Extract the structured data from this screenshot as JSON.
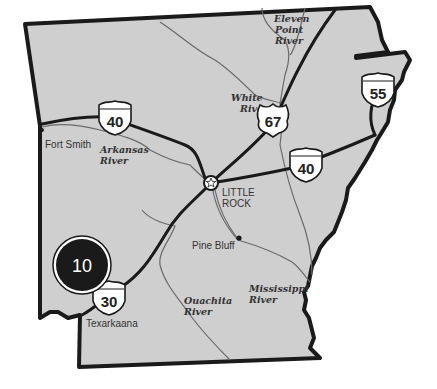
{
  "map": {
    "region": "Arkansas",
    "colors": {
      "land": "#cfcfcf",
      "border": "#1a1a1a",
      "highway": "#1a1a1a",
      "river": "#6a6a6a",
      "shield_fill": "#ffffff",
      "badge_fill": "#1a1a1a"
    },
    "badge": {
      "label": "10"
    },
    "cities": [
      {
        "id": "fort-smith",
        "name": "Fort Smith"
      },
      {
        "id": "little-rock-line1",
        "name": "LITTLE"
      },
      {
        "id": "little-rock-line2",
        "name": "ROCK"
      },
      {
        "id": "pine-bluff",
        "name": "Pine Bluff"
      },
      {
        "id": "texarkana",
        "name": "Texarkaana"
      }
    ],
    "rivers": [
      {
        "id": "arkansas",
        "line1": "Arkansas",
        "line2": "River"
      },
      {
        "id": "white",
        "line1": "White",
        "line2": "River"
      },
      {
        "id": "eleven-point",
        "line1": "Eleven",
        "line2": "Point",
        "line3": "River"
      },
      {
        "id": "ouachita",
        "line1": "Ouachita",
        "line2": "River"
      },
      {
        "id": "mississippi",
        "line1": "Mississippi",
        "line2": "River"
      }
    ],
    "highways": [
      {
        "id": "i40-west",
        "type": "interstate",
        "number": "40"
      },
      {
        "id": "us67",
        "type": "us-route",
        "number": "67"
      },
      {
        "id": "i55",
        "type": "interstate",
        "number": "55"
      },
      {
        "id": "i40-east",
        "type": "interstate",
        "number": "40"
      },
      {
        "id": "i30",
        "type": "interstate",
        "number": "30"
      }
    ]
  }
}
